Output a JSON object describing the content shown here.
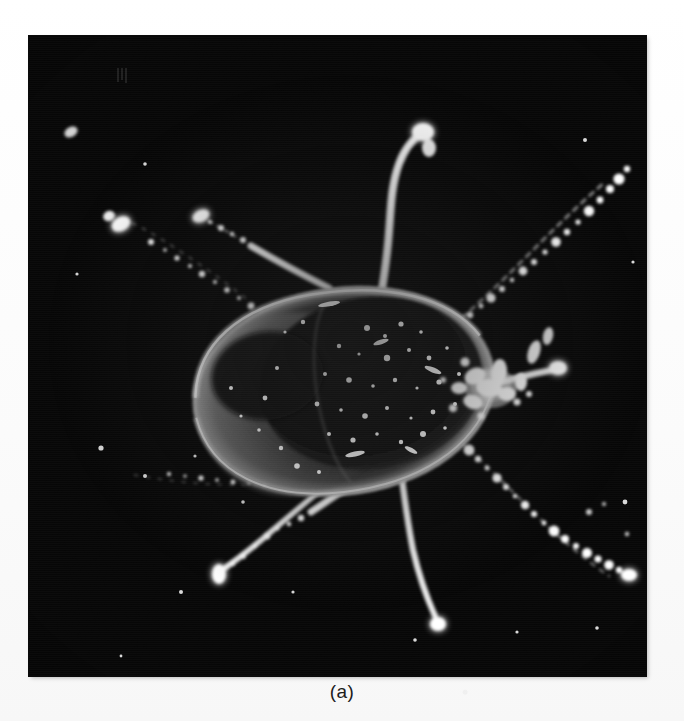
{
  "figure": {
    "caption": "(a)",
    "alt_description": "Dark-field photomicrograph of a tick",
    "background_color": "#fcfcfc",
    "plate_color": "#060606",
    "highlight_color": "#ffffff",
    "body_rim_color": "#b9b9b9",
    "plate": {
      "x": 29,
      "y": 36,
      "width": 617,
      "height": 640
    }
  },
  "subject": {
    "name": "tick",
    "view": "dorsal",
    "imaging_mode": "dark-field",
    "body": {
      "label": "idiosoma",
      "center_x": 315,
      "center_y": 355,
      "width": 300,
      "height": 205,
      "rotation_deg": -8
    },
    "scutum": {
      "label": "scutum",
      "center_x": 345,
      "center_y": 355
    },
    "capitulum": {
      "label": "capitulum",
      "center_x": 470,
      "center_y": 350
    },
    "legs": [
      {
        "name": "leg-left-anterior-outer",
        "side": "left",
        "position": "anterior-outer"
      },
      {
        "name": "leg-left-anterior-inner",
        "side": "left",
        "position": "anterior-inner"
      },
      {
        "name": "leg-left-posterior-inner",
        "side": "left",
        "position": "posterior-inner"
      },
      {
        "name": "leg-left-posterior-outer",
        "side": "left",
        "position": "posterior-outer"
      },
      {
        "name": "leg-right-anterior-vertical",
        "side": "right",
        "position": "anterior-vertical"
      },
      {
        "name": "leg-right-anterior-upper",
        "side": "right",
        "position": "anterior-upper"
      },
      {
        "name": "leg-right-middle",
        "side": "right",
        "position": "middle"
      },
      {
        "name": "leg-right-posterior",
        "side": "right",
        "position": "posterior"
      }
    ]
  }
}
